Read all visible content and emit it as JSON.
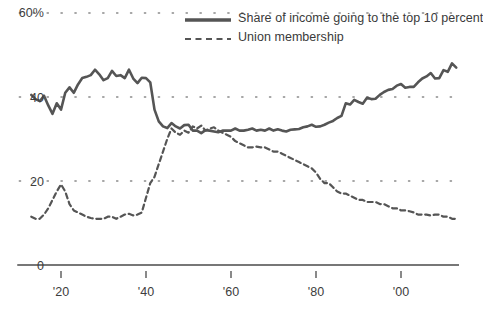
{
  "chart_data": {
    "type": "line",
    "title": "",
    "subtitle": "",
    "xlabel": "",
    "ylabel": "",
    "xlim": [
      1913,
      2014
    ],
    "ylim": [
      0,
      60
    ],
    "grid": "dotted-horizontal",
    "legend_position": "top-right",
    "y_ticks": [
      {
        "value": 60,
        "label": "60%"
      },
      {
        "value": 40,
        "label": "40"
      },
      {
        "value": 20,
        "label": "20"
      },
      {
        "value": 0,
        "label": "0"
      }
    ],
    "x_ticks": [
      {
        "value": 1920,
        "label": "'20"
      },
      {
        "value": 1940,
        "label": "'40"
      },
      {
        "value": 1960,
        "label": "'60"
      },
      {
        "value": 1980,
        "label": "'80"
      },
      {
        "value": 2000,
        "label": "'00"
      }
    ],
    "series": [
      {
        "name": "Share of income going to the top 10 percent",
        "style": "solid",
        "color": "#555555",
        "width": 2.6,
        "x": [
          1913,
          1914,
          1915,
          1916,
          1917,
          1918,
          1919,
          1920,
          1921,
          1922,
          1923,
          1924,
          1925,
          1926,
          1927,
          1928,
          1929,
          1930,
          1931,
          1932,
          1933,
          1934,
          1935,
          1936,
          1937,
          1938,
          1939,
          1940,
          1941,
          1942,
          1943,
          1944,
          1945,
          1946,
          1947,
          1948,
          1949,
          1950,
          1951,
          1952,
          1953,
          1954,
          1955,
          1956,
          1957,
          1958,
          1959,
          1960,
          1961,
          1962,
          1963,
          1964,
          1965,
          1966,
          1967,
          1968,
          1969,
          1970,
          1971,
          1972,
          1973,
          1974,
          1975,
          1976,
          1977,
          1978,
          1979,
          1980,
          1981,
          1982,
          1983,
          1984,
          1985,
          1986,
          1987,
          1988,
          1989,
          1990,
          1991,
          1992,
          1993,
          1994,
          1995,
          1996,
          1997,
          1998,
          1999,
          2000,
          2001,
          2002,
          2003,
          2004,
          2005,
          2006,
          2007,
          2008,
          2009,
          2010,
          2011,
          2012,
          2013
        ],
        "values": [
          40.5,
          39.5,
          39.0,
          40.3,
          38.0,
          36.0,
          38.5,
          37.0,
          41.0,
          42.3,
          41.0,
          43.0,
          44.5,
          44.8,
          45.2,
          46.5,
          45.4,
          44.0,
          44.5,
          46.2,
          45.0,
          45.2,
          44.5,
          46.5,
          44.4,
          43.3,
          44.6,
          44.5,
          43.5,
          37.0,
          34.2,
          33.0,
          32.6,
          33.8,
          33.0,
          32.5,
          33.3,
          33.4,
          32.0,
          32.0,
          31.4,
          32.1,
          32.0,
          31.8,
          31.6,
          32.0,
          32.0,
          32.0,
          32.5,
          32.0,
          32.0,
          32.2,
          32.5,
          32.0,
          32.2,
          32.0,
          32.5,
          32.0,
          32.3,
          32.0,
          31.8,
          32.2,
          32.3,
          32.4,
          32.8,
          33.0,
          33.4,
          32.9,
          33.0,
          33.4,
          33.9,
          34.3,
          35.0,
          35.5,
          38.5,
          38.2,
          39.3,
          38.8,
          38.4,
          39.8,
          39.5,
          39.6,
          40.5,
          41.2,
          41.7,
          41.9,
          42.7,
          43.1,
          42.2,
          42.4,
          42.4,
          43.5,
          44.4,
          44.9,
          45.7,
          44.4,
          44.5,
          46.4,
          46.0,
          48.0,
          47.0
        ]
      },
      {
        "name": "Union membership",
        "style": "dashed",
        "color": "#555555",
        "width": 2.2,
        "x": [
          1913,
          1914,
          1915,
          1916,
          1917,
          1918,
          1919,
          1920,
          1921,
          1922,
          1923,
          1924,
          1925,
          1926,
          1927,
          1928,
          1929,
          1930,
          1931,
          1932,
          1933,
          1934,
          1935,
          1936,
          1937,
          1938,
          1939,
          1940,
          1941,
          1942,
          1943,
          1944,
          1945,
          1946,
          1947,
          1948,
          1949,
          1950,
          1951,
          1952,
          1953,
          1954,
          1955,
          1956,
          1957,
          1958,
          1959,
          1960,
          1961,
          1962,
          1963,
          1964,
          1965,
          1966,
          1967,
          1968,
          1969,
          1970,
          1971,
          1972,
          1973,
          1974,
          1975,
          1976,
          1977,
          1978,
          1979,
          1980,
          1981,
          1982,
          1983,
          1984,
          1985,
          1986,
          1987,
          1988,
          1989,
          1990,
          1991,
          1992,
          1993,
          1994,
          1995,
          1996,
          1997,
          1998,
          1999,
          2000,
          2001,
          2002,
          2003,
          2004,
          2005,
          2006,
          2007,
          2008,
          2009,
          2010,
          2011,
          2012,
          2013
        ],
        "values": [
          11.5,
          11.0,
          11.0,
          12.0,
          13.5,
          15.5,
          17.5,
          19.2,
          17.5,
          14.5,
          13.0,
          12.5,
          12.0,
          11.5,
          11.2,
          11.0,
          11.0,
          11.0,
          11.5,
          11.5,
          11.0,
          11.5,
          12.0,
          12.2,
          11.8,
          12.0,
          12.5,
          16.0,
          19.5,
          21.0,
          24.0,
          27.0,
          30.0,
          32.5,
          31.5,
          31.0,
          32.0,
          31.5,
          33.0,
          32.5,
          33.2,
          32.0,
          32.5,
          32.8,
          32.0,
          31.5,
          31.0,
          30.5,
          29.5,
          29.0,
          28.5,
          28.0,
          28.0,
          28.2,
          28.0,
          28.0,
          27.5,
          27.0,
          27.0,
          26.5,
          26.0,
          25.5,
          25.0,
          24.5,
          24.0,
          23.5,
          23.0,
          22.0,
          20.5,
          19.5,
          19.5,
          18.5,
          17.5,
          17.0,
          17.0,
          16.5,
          16.0,
          15.5,
          15.5,
          15.0,
          15.0,
          15.0,
          14.5,
          14.5,
          14.0,
          13.5,
          13.5,
          13.0,
          13.0,
          12.8,
          12.5,
          12.0,
          12.0,
          12.0,
          11.8,
          12.0,
          12.0,
          11.5,
          11.5,
          11.0,
          11.0
        ]
      }
    ],
    "legend": [
      {
        "label": "Share of income going to the top 10 percent",
        "style": "solid"
      },
      {
        "label": "Union membership",
        "style": "dashed"
      }
    ]
  },
  "axis": {
    "y_tick_60": "60%",
    "y_tick_40": "40",
    "y_tick_20": "20",
    "y_tick_0": "0",
    "x_tick_20": "'20",
    "x_tick_40": "'40",
    "x_tick_60": "'60",
    "x_tick_80": "'80",
    "x_tick_00": "'00"
  },
  "legend": {
    "item_0": "Share of income going to the top 10 percent",
    "item_1": "Union membership"
  },
  "colors": {
    "line": "#555555",
    "axis": "#4a4a4a",
    "grid": "#8a8a8a",
    "text": "#3a3a3a"
  }
}
